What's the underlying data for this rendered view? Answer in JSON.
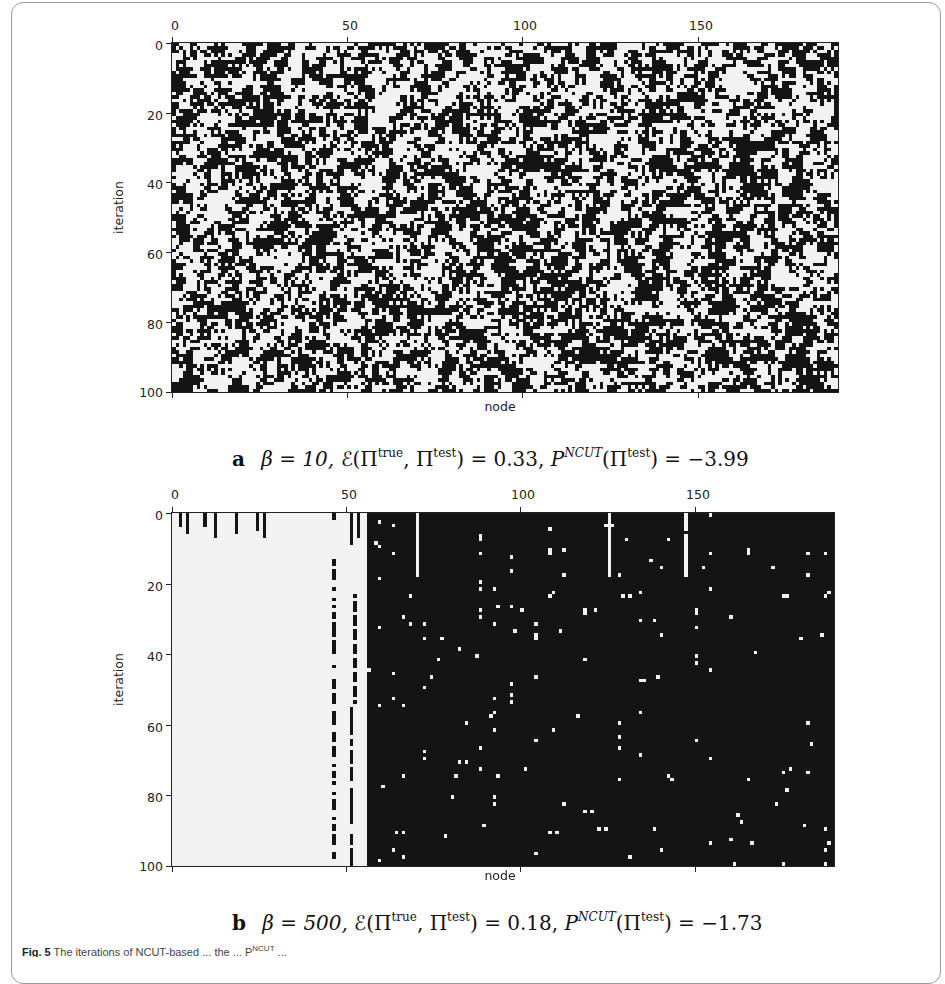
{
  "figure": {
    "caption_partial": "Fig. 5 The iterations of NCUT-based ... P",
    "caption_label": "Fig. 5",
    "caption_text": "The iterations of NCUT-based ... the ... P",
    "caption_super": "NCUT",
    "caption_tail": "..."
  },
  "panels": [
    {
      "id": "a",
      "letter": "a",
      "caption": {
        "beta": "β = 10,",
        "error_prefix": "ℰ(Π",
        "error_sup1": "true",
        "error_mid": ", Π",
        "error_sup2": "test",
        "error_value": ") = 0.33,",
        "p_prefix": "P",
        "p_sup": "NCUT",
        "p_mid": "(Π",
        "p_sup2": "test",
        "p_value": ") = −3.99"
      },
      "xlabel": "node",
      "ylabel": "iteration",
      "xticks": [
        "0",
        "50",
        "100",
        "150"
      ],
      "yticks": [
        "0",
        "20",
        "40",
        "60",
        "80",
        "100"
      ]
    },
    {
      "id": "b",
      "letter": "b",
      "caption": {
        "beta": "β = 500,",
        "error_prefix": "ℰ(Π",
        "error_sup1": "true",
        "error_mid": ", Π",
        "error_sup2": "test",
        "error_value": ") = 0.18,",
        "p_prefix": "P",
        "p_sup": "NCUT",
        "p_mid": "(Π",
        "p_sup2": "test",
        "p_value": ") = −1.73"
      },
      "xlabel": "node",
      "ylabel": "iteration",
      "xticks": [
        "0",
        "50",
        "100",
        "150"
      ],
      "yticks": [
        "0",
        "20",
        "40",
        "60",
        "80",
        "100"
      ]
    }
  ],
  "chart_data": [
    {
      "type": "heatmap",
      "title": "a  β = 10, ℰ(Π^true, Π^test) = 0.33, P^NCUT(Π^test) = −3.99",
      "xlabel": "node",
      "ylabel": "iteration",
      "xlim": [
        0,
        190
      ],
      "ylim": [
        100,
        0
      ],
      "x_ticks": [
        0,
        50,
        100,
        150
      ],
      "y_ticks": [
        0,
        20,
        40,
        60,
        80,
        100
      ],
      "colormap": "binary (black = 1, white = 0)",
      "description": "Random-looking binary noise; roughly half black, half white, with small clustered blobs; no stable column structure across iterations.",
      "fraction_black": 0.5,
      "grid": false
    },
    {
      "type": "heatmap",
      "title": "b  β = 500, ℰ(Π^true, Π^test) = 0.18, P^NCUT(Π^test) = −1.73",
      "xlabel": "node",
      "ylabel": "iteration",
      "xlim": [
        0,
        190
      ],
      "ylim": [
        100,
        0
      ],
      "x_ticks": [
        0,
        50,
        100,
        150
      ],
      "y_ticks": [
        0,
        20,
        40,
        60,
        80,
        100
      ],
      "colormap": "binary (black = 1, white = 0)",
      "description": "Nodes 0–~55 mostly white (with short black bars near iteration 0 and dashed columns at ~46 and ~51); nodes ~56–189 mostly black with persistent vertical white stripes; partition stabilizes quickly over iterations.",
      "white_region_nodes": [
        0,
        55
      ],
      "black_region_nodes": [
        56,
        189
      ],
      "white_stripe_columns_approx": [
        59,
        63,
        66,
        72,
        78,
        88,
        92,
        97,
        104,
        108,
        112,
        118,
        128,
        134,
        140,
        150,
        154,
        160,
        165,
        176,
        182,
        187
      ],
      "grid": false
    }
  ]
}
